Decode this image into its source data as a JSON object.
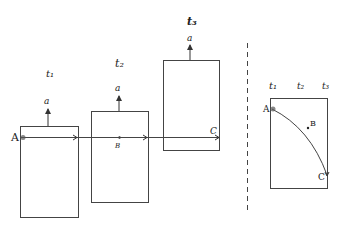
{
  "diagram": {
    "frames": [
      {
        "time_label": "t₁",
        "accel_label": "a"
      },
      {
        "time_label": "t₂",
        "accel_label": "a",
        "point_label": "B"
      },
      {
        "time_label": "t₃",
        "accel_label": "a",
        "end_label": "C"
      }
    ],
    "start_label": "A",
    "right_panel": {
      "time_labels": [
        "t₁",
        "t₂",
        "t₃"
      ],
      "points": [
        "A",
        "B",
        "C"
      ]
    }
  },
  "colors": {
    "ink": "#333333",
    "background": "#ffffff"
  }
}
